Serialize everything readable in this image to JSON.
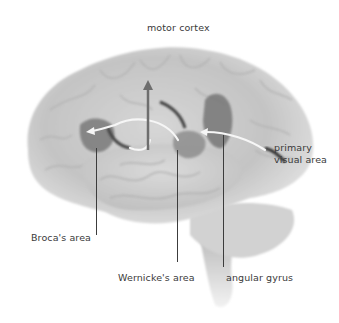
{
  "diagram": {
    "type": "anatomical-illustration",
    "labels": {
      "motor_cortex": "motor cortex",
      "primary_visual_area_line1": "primary",
      "primary_visual_area_line2": "visual area",
      "brocas_area": "Broca's area",
      "wernickes_area": "Wernicke's area",
      "angular_gyrus": "angular gyrus"
    },
    "arrows": [
      {
        "from": "primary visual area",
        "to": "angular gyrus"
      },
      {
        "from": "angular gyrus",
        "to": "Wernicke's area"
      },
      {
        "from": "Wernicke's area",
        "to": "Broca's area"
      },
      {
        "from": "Broca's area region",
        "to": "motor cortex"
      }
    ],
    "colors": {
      "brain_fill": "#c9c9c9",
      "highlight_region": "#7a7a7a",
      "arrow": "#f4f4f4",
      "leader_line": "#3c3c3c",
      "text": "#3a3a3a"
    }
  }
}
